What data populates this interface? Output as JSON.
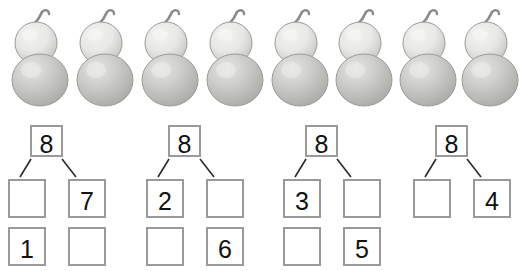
{
  "page": {
    "background_color": "#ffffff"
  },
  "objects_row": {
    "name": "gourd-row",
    "icon": "gourd-icon",
    "count": 8,
    "object_label": "gourd",
    "positions_x": [
      10,
      75,
      140,
      205,
      270,
      334,
      398,
      460
    ],
    "colors": {
      "body_light": "#e8e8e6",
      "body_mid": "#c9c9c6",
      "body_shadow": "#a9a9a6",
      "outline": "#9b9b98",
      "stem": "#8a8a86"
    }
  },
  "bonds": {
    "whole_value": "8",
    "groups": [
      {
        "name": "bond-group-1",
        "left_x": 0,
        "top": "8",
        "mid_left": "",
        "mid_right": "7",
        "low_left": "1",
        "low_right": "",
        "has_low_row": true
      },
      {
        "name": "bond-group-2",
        "left_x": 138,
        "top": "8",
        "mid_left": "2",
        "mid_right": "",
        "low_left": "",
        "low_right": "6",
        "has_low_row": true
      },
      {
        "name": "bond-group-3",
        "left_x": 275,
        "top": "8",
        "mid_left": "3",
        "mid_right": "",
        "low_left": "",
        "low_right": "5",
        "has_low_row": true
      },
      {
        "name": "bond-group-4",
        "left_x": 405,
        "top": "8",
        "mid_left": "",
        "mid_right": "4",
        "low_left": "",
        "low_right": "",
        "has_low_row": false
      }
    ]
  },
  "colors": {
    "box_border": "#9a9a9a",
    "numeral": "#111111",
    "connector_line": "#2a2a2a"
  }
}
